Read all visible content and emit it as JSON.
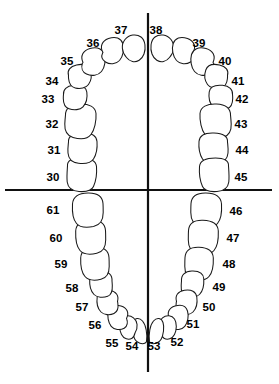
{
  "diagram": {
    "type": "dental-arch-chart",
    "background_color": "#ffffff",
    "line_color": "#111111",
    "tooth_outline_color": "#1a1a1a",
    "label_color": "#000000"
  },
  "axes": {
    "vertical_midline": {
      "x": 148,
      "y1": 13,
      "y2": 372
    },
    "horizontal_occlusal_line": {
      "y": 190,
      "x1": 5,
      "x2": 272
    }
  },
  "chart_data": {
    "type": "diagram",
    "arches": [
      {
        "name": "upper",
        "label": "Upper Arch (Maxillary)",
        "numbers": [
          30,
          31,
          32,
          33,
          34,
          35,
          36,
          37,
          38,
          39,
          40,
          41,
          42,
          43,
          44,
          45
        ]
      },
      {
        "name": "lower",
        "label": "Lower Arch (Mandibular)",
        "numbers": [
          46,
          47,
          48,
          49,
          50,
          51,
          52,
          53,
          54,
          55,
          56,
          57,
          58,
          59,
          60,
          61
        ]
      }
    ],
    "total_teeth": 32
  },
  "teeth": [
    {
      "number": "30",
      "arch": "upper",
      "side": "left",
      "kind": "molar",
      "cx": 81,
      "cy": 176,
      "label_x": 53,
      "label_y": 178,
      "rx": 15.5,
      "ry": 13.5,
      "rot": -4,
      "path": "M 67.5,166 C 67.0,160.5 72.0,158.0 80.5,158.0 C 90.0,158.0 96.0,160.5 96.5,166.5 C 97.0,173.5 95.5,182.0 93.5,186.5 C 91.5,190.8 85.5,192.0 79.0,191.5 C 72.0,191.0 68.0,188.0 67.2,182.0 C 66.6,176.5 67.2,170.5 67.5,166 Z"
    },
    {
      "number": "31",
      "arch": "upper",
      "side": "left",
      "kind": "molar",
      "cx": 82,
      "cy": 149,
      "label_x": 54,
      "label_y": 151,
      "rx": 15.0,
      "ry": 12.0,
      "rot": -6,
      "path": "M 68.5,142 C 68.0,136.0 73.0,133.5 82.0,133.0 C 91.0,132.6 96.5,135.5 97.0,141.5 C 97.5,148.0 96.0,155.0 93.5,159.0 C 91.0,163.0 85.0,164.0 78.5,163.3 C 71.5,162.5 68.5,159.0 68.0,153.0 C 67.6,148.5 68.2,145.0 68.5,142 Z"
    },
    {
      "number": "32",
      "arch": "upper",
      "side": "left",
      "kind": "molar",
      "cx": 80,
      "cy": 122,
      "label_x": 52,
      "label_y": 125,
      "rx": 16.0,
      "ry": 13.0,
      "rot": -10,
      "path": "M 65.5,115 C 65.5,108.0 70.5,104.5 79.5,104.0 C 89.0,103.5 95.5,107.0 96.0,113.5 C 96.5,121.0 94.5,130.0 91.0,134.5 C 87.5,139.0 80.0,139.5 73.0,137.5 C 66.5,135.5 64.5,130.5 64.8,124.0 C 65.0,119.5 65.3,117.0 65.5,115 Z"
    },
    {
      "number": "33",
      "arch": "upper",
      "side": "left",
      "kind": "premolar",
      "cx": 75,
      "cy": 98,
      "label_x": 48,
      "label_y": 100,
      "rx": 12.5,
      "ry": 10.5,
      "rot": -14,
      "path": "M 63.5,94.5 C 63.0,89.5 66.5,86.0 73.5,85.3 C 81.0,84.6 86.0,87.0 86.8,92.0 C 87.6,97.5 86.0,103.5 83.0,106.8 C 80.0,110.0 74.0,110.5 69.0,108.8 C 64.3,107.2 63.3,103.0 63.3,98.5 C 63.3,96.5 63.4,95.3 63.5,94.5 Z"
    },
    {
      "number": "34",
      "arch": "upper",
      "side": "left",
      "kind": "premolar",
      "cx": 79,
      "cy": 78,
      "label_x": 52,
      "label_y": 82,
      "rx": 12.0,
      "ry": 10.0,
      "rot": -22,
      "path": "M 68.5,75.5 C 67.0,70.5 70.0,66.5 76.5,65.0 C 83.5,63.4 88.5,65.3 90.2,70.0 C 92.0,75.2 91.0,81.0 88.5,84.5 C 86.0,88.0 80.3,89.3 75.2,88.0 C 70.5,86.8 69.0,83.0 68.6,78.8 C 68.4,77.0 68.4,76.2 68.5,75.5 Z"
    },
    {
      "number": "35",
      "arch": "upper",
      "side": "left",
      "kind": "canine",
      "cx": 92,
      "cy": 62,
      "label_x": 67,
      "label_y": 62,
      "rx": 12.0,
      "ry": 11.0,
      "rot": -32,
      "path": "M 83.0,62.5 C 80.0,56.0 83.0,50.5 90.0,48.5 C 97.5,46.4 103.0,49.0 104.5,54.5 C 106.0,60.0 104.8,67.5 101.5,71.5 C 98.2,75.5 91.5,76.5 86.5,74.0 C 82.2,71.9 81.0,67.5 82.3,63.5 C 82.6,62.9 82.8,62.7 83.0,62.5 Z"
    },
    {
      "number": "36",
      "arch": "upper",
      "side": "left",
      "kind": "incisor",
      "cx": 110,
      "cy": 51,
      "label_x": 93,
      "label_y": 44,
      "rx": 10.5,
      "ry": 10.5,
      "rot": -42,
      "path": "M 103.0,52.5 C 99.5,46.5 102.0,41.0 108.5,38.6 C 115.5,36.0 121.0,38.2 122.8,43.5 C 124.6,49.0 123.0,56.5 119.5,60.5 C 116.0,64.3 109.8,64.8 105.5,62.0 C 101.8,59.6 101.3,55.8 102.6,53.0 C 102.8,52.8 102.9,52.6 103.0,52.5 Z"
    },
    {
      "number": "37",
      "arch": "upper",
      "side": "left",
      "kind": "incisor",
      "cx": 131,
      "cy": 47,
      "label_x": 121,
      "label_y": 31,
      "rx": 11.5,
      "ry": 13.0,
      "rot": -60,
      "path": "M 126.5,57.5 C 121.5,52.0 121.0,44.5 125.0,39.5 C 129.0,34.5 136.5,33.5 141.0,37.0 C 145.5,40.5 146.0,48.5 144.0,54.0 C 142.0,59.5 137.0,62.5 132.5,61.5 C 129.5,60.8 127.8,59.2 126.5,57.5 Z"
    },
    {
      "number": "38",
      "arch": "upper",
      "side": "right",
      "kind": "incisor",
      "cx": 165,
      "cy": 47,
      "label_x": 156,
      "label_y": 31,
      "rx": 11.5,
      "ry": 13.0,
      "rot": 60,
      "path": "M 169.5,57.5 C 174.5,52.0 175.0,44.5 171.0,39.5 C 167.0,34.5 159.5,33.5 155.0,37.0 C 150.5,40.5 150.0,48.5 152.0,54.0 C 154.0,59.5 159.0,62.5 163.5,61.5 C 166.5,60.8 168.2,59.2 169.5,57.5 Z"
    },
    {
      "number": "39",
      "arch": "upper",
      "side": "right",
      "kind": "incisor",
      "cx": 186,
      "cy": 51,
      "label_x": 199,
      "label_y": 44,
      "rx": 10.5,
      "ry": 10.5,
      "rot": 42,
      "path": "M 193.0,52.5 C 196.5,46.5 194.0,41.0 187.5,38.6 C 180.5,36.0 175.0,38.2 173.2,43.5 C 171.4,49.0 173.0,56.5 176.5,60.5 C 180.0,64.3 186.2,64.8 190.5,62.0 C 194.2,59.6 194.7,55.8 193.4,53.0 C 193.2,52.8 193.1,52.6 193.0,52.5 Z"
    },
    {
      "number": "40",
      "arch": "upper",
      "side": "right",
      "kind": "canine",
      "cx": 204,
      "cy": 62,
      "label_x": 225,
      "label_y": 62,
      "rx": 12.0,
      "ry": 11.0,
      "rot": 32,
      "path": "M 213.0,62.5 C 216.0,56.0 213.0,50.5 206.0,48.5 C 198.5,46.4 193.0,49.0 191.5,54.5 C 190.0,60.0 191.2,67.5 194.5,71.5 C 197.8,75.5 204.5,76.5 209.5,74.0 C 213.8,71.9 215.0,67.5 213.7,63.5 C 213.4,62.9 213.2,62.7 213.0,62.5 Z"
    },
    {
      "number": "41",
      "arch": "upper",
      "side": "right",
      "kind": "premolar",
      "cx": 217,
      "cy": 78,
      "label_x": 238,
      "label_y": 82,
      "rx": 12.0,
      "ry": 10.0,
      "rot": 22,
      "path": "M 227.5,75.5 C 229.0,70.5 226.0,66.5 219.5,65.0 C 212.5,63.4 207.5,65.3 205.8,70.0 C 204.0,75.2 205.0,81.0 207.5,84.5 C 210.0,88.0 215.7,89.3 220.8,88.0 C 225.5,86.8 227.0,83.0 227.4,78.8 C 227.6,77.0 227.6,76.2 227.5,75.5 Z"
    },
    {
      "number": "42",
      "arch": "upper",
      "side": "right",
      "kind": "premolar",
      "cx": 221,
      "cy": 98,
      "label_x": 242,
      "label_y": 100,
      "rx": 12.5,
      "ry": 10.5,
      "rot": 14,
      "path": "M 232.5,94.5 C 233.0,89.5 229.5,86.0 222.5,85.3 C 215.0,84.6 210.0,87.0 209.2,92.0 C 208.4,97.5 210.0,103.5 213.0,106.8 C 216.0,110.0 222.0,110.5 227.0,108.8 C 231.7,107.2 232.7,103.0 232.7,98.5 C 232.7,96.5 232.6,95.3 232.5,94.5 Z"
    },
    {
      "number": "43",
      "arch": "upper",
      "side": "right",
      "kind": "molar",
      "cx": 216,
      "cy": 122,
      "label_x": 241,
      "label_y": 125,
      "rx": 16.0,
      "ry": 13.0,
      "rot": 10,
      "path": "M 230.5,115 C 230.5,108.0 225.5,104.5 216.5,104.0 C 207.0,103.5 200.5,107.0 200.0,113.5 C 199.5,121.0 201.5,130.0 205.0,134.5 C 208.5,139.0 216.0,139.5 223.0,137.5 C 229.5,135.5 231.5,130.5 231.2,124.0 C 231.0,119.5 230.7,117.0 230.5,115 Z"
    },
    {
      "number": "44",
      "arch": "upper",
      "side": "right",
      "kind": "molar",
      "cx": 214,
      "cy": 149,
      "label_x": 242,
      "label_y": 151,
      "rx": 15.0,
      "ry": 12.0,
      "rot": 6,
      "path": "M 227.5,142 C 228.0,136.0 223.0,133.5 214.0,133.0 C 205.0,132.6 199.5,135.5 199.0,141.5 C 198.5,148.0 200.0,155.0 202.5,159.0 C 205.0,163.0 211.0,164.0 217.5,163.3 C 224.5,162.5 227.5,159.0 228.0,153.0 C 228.4,148.5 227.8,145.0 227.5,142 Z"
    },
    {
      "number": "45",
      "arch": "upper",
      "side": "right",
      "kind": "molar",
      "cx": 213,
      "cy": 176,
      "label_x": 241,
      "label_y": 178,
      "rx": 15.5,
      "ry": 13.5,
      "rot": 4,
      "path": "M 228.5,166 C 229.0,160.5 224.0,158.0 215.5,158.0 C 206.0,158.0 200.0,160.5 199.5,166.5 C 199.0,173.5 200.5,182.0 202.5,186.5 C 204.5,190.8 210.5,192.0 217.0,191.5 C 224.0,191.0 228.0,188.0 228.8,182.0 C 229.4,176.5 228.8,170.5 228.5,166 Z"
    },
    {
      "number": "46",
      "arch": "lower",
      "side": "right",
      "kind": "molar",
      "cx": 206,
      "cy": 209,
      "label_x": 236,
      "label_y": 212,
      "rx": 16.0,
      "ry": 14.0,
      "rot": 0,
      "path": "M 191.0,203.5 C 191.5,196.5 197.0,192.8 206.0,193.0 C 215.5,193.2 221.0,196.8 221.5,204.0 C 222.0,212.5 220.5,220.0 217.5,223.5 C 214.5,227.0 207.5,227.8 200.5,226.5 C 193.5,225.0 190.8,220.0 190.8,212.5 C 190.8,207.5 190.9,205.0 191.0,203.5 Z"
    },
    {
      "number": "47",
      "arch": "lower",
      "side": "right",
      "kind": "molar",
      "cx": 203,
      "cy": 236,
      "label_x": 233,
      "label_y": 239,
      "rx": 15.5,
      "ry": 13.5,
      "rot": 4,
      "path": "M 188.5,230.5 C 189.0,223.5 194.5,220.0 203.0,220.3 C 212.5,220.6 218.0,224.0 218.3,231.0 C 218.6,239.0 217.0,247.0 214.0,250.5 C 211.0,254.0 204.0,254.8 197.2,253.3 C 190.5,251.8 188.3,247.0 188.3,240.0 C 188.3,235.0 188.4,232.0 188.5,230.5 Z"
    },
    {
      "number": "48",
      "arch": "lower",
      "side": "right",
      "kind": "molar",
      "cx": 199,
      "cy": 263,
      "label_x": 229,
      "label_y": 265,
      "rx": 14.5,
      "ry": 13.0,
      "rot": 10,
      "path": "M 185.0,257.5 C 185.5,250.5 190.5,247.0 199.0,247.3 C 208.0,247.6 213.0,251.0 213.3,258.0 C 213.6,265.5 212.0,273.0 209.0,276.5 C 206.0,280.0 199.5,280.8 193.0,279.3 C 186.8,277.8 184.8,273.0 184.8,266.5 C 184.8,261.5 184.9,259.0 185.0,257.5 Z"
    },
    {
      "number": "49",
      "arch": "lower",
      "side": "right",
      "kind": "premolar",
      "cx": 192,
      "cy": 285,
      "label_x": 219,
      "label_y": 288,
      "rx": 11.5,
      "ry": 10.5,
      "rot": 18,
      "path": "M 181.5,281.0 C 181.0,275.0 185.0,271.3 191.8,271.0 C 199.0,270.7 203.5,273.5 203.8,279.0 C 204.1,285.0 202.5,291.5 199.5,294.5 C 196.5,297.5 190.5,298.0 185.8,296.3 C 181.5,294.7 181.0,290.5 181.2,285.5 C 181.3,283.3 181.4,282.0 181.5,281.0 Z"
    },
    {
      "number": "50",
      "arch": "lower",
      "side": "right",
      "kind": "premolar",
      "cx": 186,
      "cy": 304,
      "label_x": 209,
      "label_y": 308,
      "rx": 11.0,
      "ry": 10.0,
      "rot": 28,
      "path": "M 176.5,301.5 C 174.8,295.5 178.0,291.3 184.5,290.3 C 191.5,289.2 196.0,291.8 196.8,297.0 C 197.6,302.8 196.0,309.0 193.0,312.0 C 190.0,315.0 184.3,315.5 180.0,313.5 C 176.2,311.7 175.5,307.5 176.2,303.0 C 176.3,302.2 176.4,301.8 176.5,301.5 Z"
    },
    {
      "number": "51",
      "arch": "lower",
      "side": "right",
      "kind": "canine",
      "cx": 178,
      "cy": 319,
      "label_x": 193,
      "label_y": 325,
      "rx": 10.0,
      "ry": 10.0,
      "rot": 40,
      "path": "M 169.5,318.5 C 166.5,312.8 169.0,307.8 175.0,306.0 C 181.5,304.1 186.0,306.2 187.5,311.0 C 189.0,316.0 187.8,322.8 184.8,326.3 C 181.8,329.8 176.0,330.5 171.8,328.2 C 168.2,326.2 168.3,321.5 169.2,319.2 C 169.3,318.9 169.4,318.7 169.5,318.5 Z"
    },
    {
      "number": "52",
      "arch": "lower",
      "side": "right",
      "kind": "incisor",
      "cx": 168,
      "cy": 329,
      "label_x": 177,
      "label_y": 343,
      "rx": 8.0,
      "ry": 9.5,
      "rot": 55,
      "path": "M 161.0,333.0 C 157.5,327.5 158.5,321.0 162.5,317.8 C 166.5,314.6 172.0,315.3 174.5,319.0 C 177.0,322.8 176.8,330.0 174.5,334.5 C 172.2,339.0 167.5,340.3 164.0,338.3 C 162.2,337.3 161.5,335.0 161.0,333.0 Z"
    },
    {
      "number": "53",
      "arch": "lower",
      "side": "right",
      "kind": "incisor",
      "cx": 156,
      "cy": 332,
      "label_x": 154,
      "label_y": 347,
      "rx": 7.0,
      "ry": 10.0,
      "rot": 72,
      "path": "M 149.5,341.5 C 148.5,334.0 150.0,325.0 153.5,321.0 C 157.0,317.0 161.5,318.0 163.0,322.5 C 164.5,327.0 163.5,335.0 161.0,339.5 C 158.8,343.4 153.5,344.5 150.8,343.0 C 150.0,342.6 149.7,342.1 149.5,341.5 Z"
    },
    {
      "number": "54",
      "arch": "lower",
      "side": "left",
      "kind": "incisor",
      "cx": 140,
      "cy": 332,
      "label_x": 132,
      "label_y": 347,
      "rx": 7.0,
      "ry": 10.0,
      "rot": -72,
      "path": "M 146.5,341.5 C 147.5,334.0 146.0,325.0 142.5,321.0 C 139.0,317.0 134.5,318.0 133.0,322.5 C 131.5,327.0 132.5,335.0 135.0,339.5 C 137.2,343.4 142.5,344.5 145.2,343.0 C 146.0,342.6 146.3,342.1 146.5,341.5 Z"
    },
    {
      "number": "55",
      "arch": "lower",
      "side": "left",
      "kind": "incisor",
      "cx": 128,
      "cy": 329,
      "label_x": 112,
      "label_y": 344,
      "rx": 8.0,
      "ry": 9.5,
      "rot": -55,
      "path": "M 135.0,333.0 C 138.5,327.5 137.5,321.0 133.5,317.8 C 129.5,314.6 124.0,315.3 121.5,319.0 C 119.0,322.8 119.2,330.0 121.5,334.5 C 123.8,339.0 128.5,340.3 132.0,338.3 C 133.8,337.3 134.5,335.0 135.0,333.0 Z"
    },
    {
      "number": "56",
      "arch": "lower",
      "side": "left",
      "kind": "canine",
      "cx": 117,
      "cy": 319,
      "label_x": 95,
      "label_y": 326,
      "rx": 10.0,
      "ry": 10.0,
      "rot": -40,
      "path": "M 126.5,318.5 C 129.5,312.8 127.0,307.8 121.0,306.0 C 114.5,304.1 110.0,306.2 108.5,311.0 C 107.0,316.0 108.2,322.8 111.2,326.3 C 114.2,329.8 120.0,330.5 124.2,328.2 C 127.8,326.2 127.7,321.5 126.8,319.2 C 126.7,318.9 126.6,318.7 126.5,318.5 Z"
    },
    {
      "number": "57",
      "arch": "lower",
      "side": "left",
      "kind": "premolar",
      "cx": 108,
      "cy": 304,
      "label_x": 82,
      "label_y": 308,
      "rx": 11.0,
      "ry": 10.0,
      "rot": -28,
      "path": "M 117.5,301.5 C 119.2,295.5 116.0,291.3 109.5,290.3 C 102.5,289.2 98.0,291.8 97.2,297.0 C 96.4,302.8 98.0,309.0 101.0,312.0 C 104.0,315.0 109.7,315.5 114.0,313.5 C 117.8,311.7 118.5,307.5 117.8,303.0 C 117.7,302.2 117.6,301.8 117.5,301.5 Z"
    },
    {
      "number": "58",
      "arch": "lower",
      "side": "left",
      "kind": "premolar",
      "cx": 101,
      "cy": 285,
      "label_x": 72,
      "label_y": 289,
      "rx": 11.5,
      "ry": 10.5,
      "rot": -18,
      "path": "M 112.0,281.0 C 112.5,275.0 108.5,271.3 101.7,271.0 C 94.5,270.7 90.0,273.5 89.7,279.0 C 89.4,285.0 91.0,291.5 94.0,294.5 C 97.0,297.5 103.0,298.0 107.7,296.3 C 112.0,294.7 112.5,290.5 112.3,285.5 C 112.2,283.3 112.1,282.0 112.0,281.0 Z"
    },
    {
      "number": "59",
      "arch": "lower",
      "side": "left",
      "kind": "molar",
      "cx": 95,
      "cy": 263,
      "label_x": 61,
      "label_y": 265,
      "rx": 14.5,
      "ry": 13.0,
      "rot": -10,
      "path": "M 109.0,257.5 C 108.5,250.5 103.5,247.0 95.0,247.3 C 86.0,247.6 81.0,251.0 80.7,258.0 C 80.4,265.5 82.0,273.0 85.0,276.5 C 88.0,280.0 94.5,280.8 101.0,279.3 C 107.2,277.8 109.2,273.0 109.2,266.5 C 109.2,261.5 109.1,259.0 109.0,257.5 Z"
    },
    {
      "number": "60",
      "arch": "lower",
      "side": "left",
      "kind": "molar",
      "cx": 91,
      "cy": 236,
      "label_x": 56,
      "label_y": 239,
      "rx": 15.5,
      "ry": 13.5,
      "rot": -4,
      "path": "M 105.5,230.5 C 105.0,223.5 99.5,220.0 91.0,220.3 C 81.5,220.6 76.0,224.0 75.7,231.0 C 75.4,239.0 77.0,247.0 80.0,250.5 C 83.0,254.0 90.0,254.8 96.8,253.3 C 103.5,251.8 105.7,247.0 105.7,240.0 C 105.7,235.0 105.6,232.0 105.5,230.5 Z"
    },
    {
      "number": "61",
      "arch": "lower",
      "side": "left",
      "kind": "molar",
      "cx": 88,
      "cy": 209,
      "label_x": 53,
      "label_y": 211,
      "rx": 16.0,
      "ry": 14.0,
      "rot": 0,
      "path": "M 103.0,203.5 C 102.5,196.5 97.0,192.8 88.0,193.0 C 78.5,193.2 73.0,196.8 72.5,204.0 C 72.0,212.5 73.5,220.0 76.5,223.5 C 79.5,227.0 86.5,227.8 93.5,226.5 C 100.5,225.0 103.2,220.0 103.2,212.5 C 103.2,207.5 103.1,205.0 103.0,203.5 Z"
    }
  ]
}
